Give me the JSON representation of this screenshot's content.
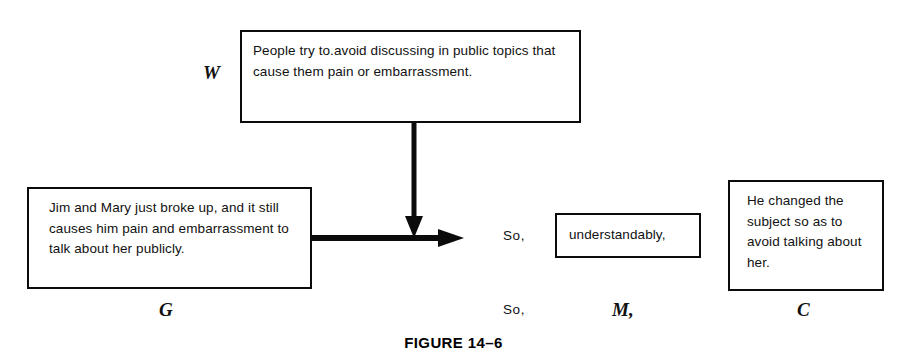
{
  "figure": {
    "caption": "FIGURE 14–6",
    "boxes": {
      "warrant": {
        "symbol": "W",
        "text": "People try to.avoid discussing in public topics that cause them pain or embarrassment."
      },
      "grounds": {
        "symbol": "G",
        "text": "Jim and Mary just broke up, and it still causes him pain and embarrassment to talk about her publicly."
      },
      "modal": {
        "symbol": "M,",
        "text": "understandably,"
      },
      "claim": {
        "symbol": "C",
        "text": "He changed the subject so as to avoid talking about her."
      }
    },
    "connectives": {
      "so_top": "So,",
      "so_bottom": "So,"
    },
    "colors": {
      "ink": "#0b0b0b",
      "background": "#ffffff"
    }
  }
}
